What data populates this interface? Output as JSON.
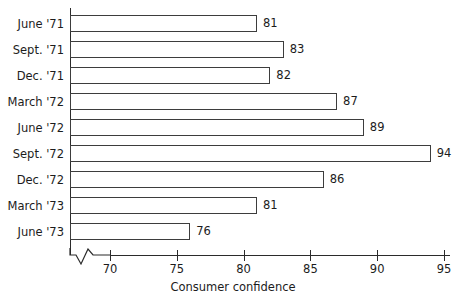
{
  "chart_data": {
    "type": "bar",
    "orientation": "horizontal",
    "title": "",
    "subtitle": "",
    "xlabel": "Consumer confidence",
    "ylabel": "",
    "categories": [
      "June '71",
      "Sept. '71",
      "Dec. '71",
      "March '72",
      "June '72",
      "Sept. '72",
      "Dec. '72",
      "March '73",
      "June '73"
    ],
    "values": [
      81,
      83,
      82,
      87,
      89,
      94,
      86,
      81,
      76
    ],
    "data_labels": [
      "81",
      "83",
      "82",
      "87",
      "89",
      "94",
      "86",
      "81",
      "76"
    ],
    "xlim": [
      70,
      95
    ],
    "xticks": [
      70,
      75,
      80,
      85,
      90,
      95
    ],
    "xtick_labels": [
      "70",
      "75",
      "80",
      "85",
      "90",
      "95"
    ],
    "grid": false,
    "legend": false,
    "legend_position": "none",
    "axis_break": true,
    "axis_break_note": "zigzag break on x-axis between origin and 70",
    "bar_style": {
      "fill": "#ffffff",
      "stroke": "#3d3d3d"
    }
  },
  "axis": {
    "x_title": "Consumer confidence"
  }
}
